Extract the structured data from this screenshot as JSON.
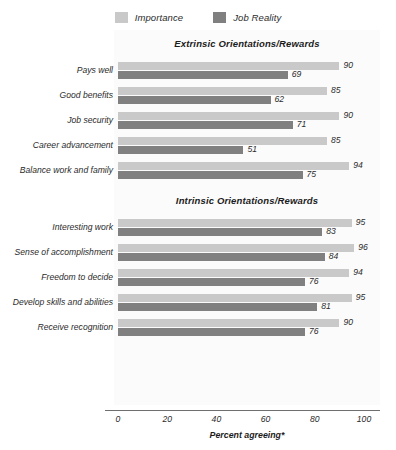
{
  "legend": {
    "items": [
      {
        "label": "Importance",
        "color": "#c9c9c9",
        "key": "importance"
      },
      {
        "label": "Job Reality",
        "color": "#808080",
        "key": "reality"
      }
    ]
  },
  "axis": {
    "title": "Percent agreeing*",
    "ticks": [
      "0",
      "20",
      "40",
      "60",
      "80",
      "100"
    ]
  },
  "chart_data": {
    "type": "bar",
    "orientation": "horizontal",
    "title": "",
    "xlabel": "Percent agreeing*",
    "ylabel": "",
    "xlim": [
      0,
      100
    ],
    "xticks": [
      0,
      20,
      40,
      60,
      80,
      100
    ],
    "grid": false,
    "legend_position": "top-center",
    "series": [
      {
        "name": "Importance",
        "color": "#c9c9c9"
      },
      {
        "name": "Job Reality",
        "color": "#808080"
      }
    ],
    "groups": [
      {
        "name": "Extrinsic Orientations/Rewards",
        "categories": [
          "Pays well",
          "Good benefits",
          "Job security",
          "Career advancement",
          "Balance work and family"
        ],
        "importance": [
          90,
          85,
          90,
          85,
          94
        ],
        "reality": [
          69,
          62,
          71,
          51,
          75
        ]
      },
      {
        "name": "Intrinsic Orientations/Rewards",
        "categories": [
          "Interesting work",
          "Sense of accomplishment",
          "Freedom to decide",
          "Develop skills and abilities",
          "Receive recognition"
        ],
        "importance": [
          95,
          96,
          94,
          95,
          90
        ],
        "reality": [
          83,
          84,
          76,
          81,
          76
        ]
      }
    ]
  }
}
